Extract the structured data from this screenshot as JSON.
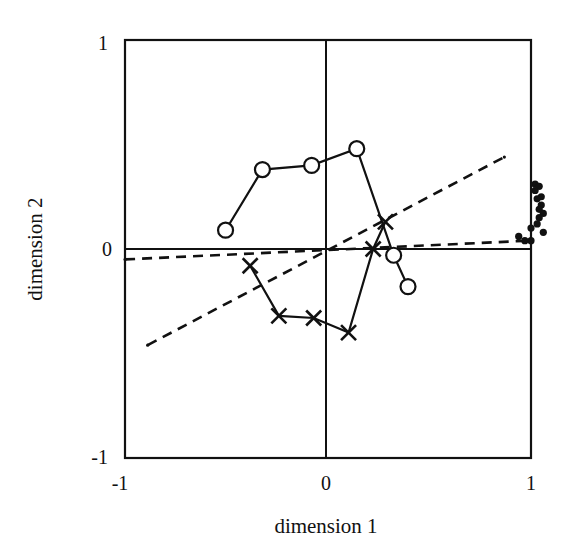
{
  "chart_data": {
    "type": "scatter",
    "title": "",
    "xlabel": "dimension 1",
    "ylabel": "dimension 2",
    "xlim": [
      -1,
      1
    ],
    "ylim": [
      -1,
      1
    ],
    "x_ticks": [
      "-1",
      "0",
      "1"
    ],
    "y_ticks": [
      "1",
      "0",
      "-1"
    ],
    "grid": false,
    "zero_lines": true,
    "legend": "none",
    "series": [
      {
        "name": "circles",
        "marker": "open-circle",
        "line": "solid",
        "points": [
          [
            -0.49,
            0.09
          ],
          [
            -0.31,
            0.38
          ],
          [
            -0.07,
            0.4
          ],
          [
            0.15,
            0.48
          ],
          [
            0.33,
            -0.03
          ],
          [
            0.4,
            -0.18
          ]
        ]
      },
      {
        "name": "crosses",
        "marker": "x",
        "line": "solid",
        "points": [
          [
            -0.37,
            -0.08
          ],
          [
            -0.23,
            -0.32
          ],
          [
            -0.06,
            -0.33
          ],
          [
            0.11,
            -0.4
          ],
          [
            0.23,
            0.0
          ],
          [
            0.29,
            0.13
          ]
        ]
      },
      {
        "name": "dashed-diagonal",
        "marker": "small-dot-end",
        "line": "dashed",
        "points": [
          [
            -0.87,
            -0.46
          ],
          [
            0.87,
            0.44
          ]
        ]
      },
      {
        "name": "dashed-horizontal",
        "marker": "small-dot-end",
        "line": "dashed",
        "points": [
          [
            -0.98,
            -0.05
          ],
          [
            1.0,
            0.04
          ]
        ]
      },
      {
        "name": "dots",
        "marker": "filled-dot",
        "line": "none",
        "points": [
          [
            1.02,
            0.31
          ],
          [
            1.04,
            0.3
          ],
          [
            1.02,
            0.28
          ],
          [
            1.05,
            0.25
          ],
          [
            1.03,
            0.24
          ],
          [
            1.05,
            0.21
          ],
          [
            1.04,
            0.19
          ],
          [
            1.06,
            0.17
          ],
          [
            1.04,
            0.15
          ],
          [
            1.03,
            0.12
          ],
          [
            1.0,
            0.1
          ],
          [
            0.94,
            0.06
          ],
          [
            1.06,
            0.08
          ],
          [
            1.0,
            0.04
          ],
          [
            0.97,
            0.04
          ]
        ]
      }
    ]
  }
}
